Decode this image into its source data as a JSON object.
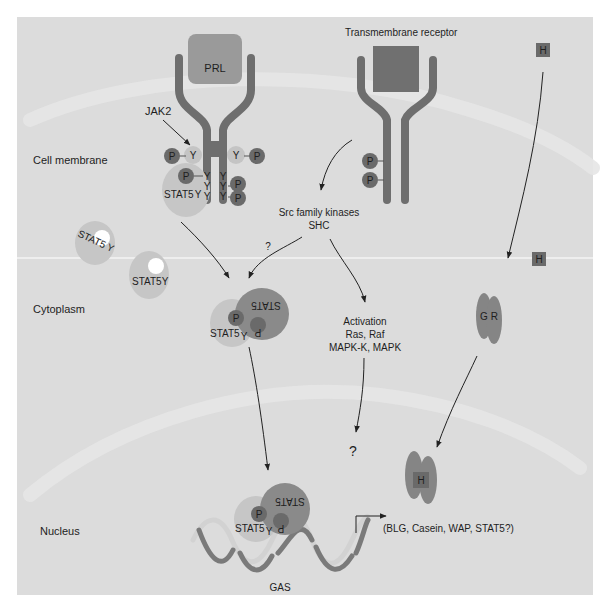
{
  "figure": {
    "colors": {
      "panel_bg": "#dcdcdc",
      "membrane_band": "#e8e8e8",
      "receptor": "#6e6e6e",
      "ligand_prl": "#9a9a9a",
      "ligand_tm": "#707070",
      "phospho": "#6a6a6a",
      "tyrosine_circle": "#c4c4c4",
      "stat5_light": "#c6c6c6",
      "stat5_dark": "#8a8a8a",
      "gr": "#858585",
      "hormone": "#6a6a6a",
      "dna_dark": "#7a7a7a",
      "dna_light": "#d2d2d2"
    },
    "compartments": {
      "cell_membrane": "Cell membrane",
      "cytoplasm": "Cytoplasm",
      "nucleus": "Nucleus"
    },
    "prl_receptor": {
      "ligand": "PRL",
      "kinase_label": "JAK2",
      "tyrosine": "Y",
      "phospho": "P",
      "stat5_docked": "STAT5",
      "stat5_docked_y": "Y"
    },
    "transmembrane_receptor": {
      "title": "Transmembrane receptor",
      "phospho": "P"
    },
    "hormone": {
      "label": "H"
    },
    "cytoplasmic_stat5": {
      "monomer_a": "STAT5 Y",
      "monomer_b": "STAT5Y"
    },
    "src_pathway": {
      "line1": "Src family kinases",
      "line2": "SHC",
      "uncertain": "?"
    },
    "stat5_dimer": {
      "left": "STAT5",
      "left_y": "Y",
      "right_flipped": "STAT5",
      "phospho": "P"
    },
    "mapk_pathway": {
      "line1": "Activation",
      "line2": "Ras, Raf",
      "line3": "MAPK-K, MAPK",
      "result": "?"
    },
    "glucocorticoid_receptor": {
      "label": "G R"
    },
    "nuclear_complex": {
      "hormone": "H"
    },
    "dna": {
      "element": "GAS",
      "target_genes": "(BLG, Casein, WAP, STAT5?)"
    }
  }
}
